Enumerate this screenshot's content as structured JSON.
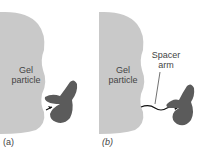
{
  "panels": [
    {
      "id": "a",
      "caption": "(a)",
      "gel_label_line1": "Gel",
      "gel_label_line2": "particle"
    },
    {
      "id": "b",
      "caption": "(b)",
      "gel_label_line1": "Gel",
      "gel_label_line2": "particle",
      "spacer_label_line1": "Spacer",
      "spacer_label_line2": "arm"
    }
  ],
  "colors": {
    "gel": "#c9c9c9",
    "protein": "#5b5b5b",
    "arrow": "#111111",
    "text": "#444444"
  }
}
